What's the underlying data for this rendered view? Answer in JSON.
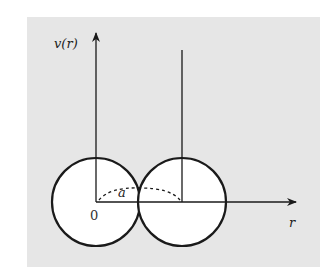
{
  "diagram": {
    "y_axis_label": "v(r)",
    "x_axis_label": "r",
    "origin_label": "0",
    "distance_label": "a",
    "colors": {
      "background": "#e6e6e6",
      "stroke": "#1a1a1a",
      "circle_fill": "#ffffff"
    }
  }
}
